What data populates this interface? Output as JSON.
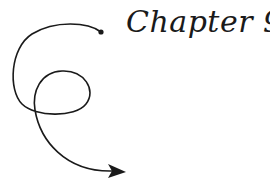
{
  "title": "Chapter 9",
  "colors": {
    "ink": "#1a1a1a",
    "background": "#ffffff"
  },
  "decoration": {
    "icon": "curly-arrow-icon"
  }
}
